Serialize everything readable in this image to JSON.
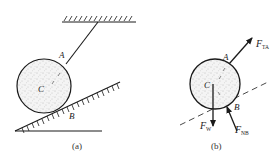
{
  "figure_a": {
    "caption": "(a)",
    "labels": {
      "A": "A",
      "C": "C",
      "B": "B"
    },
    "elements": [
      "ceiling-support",
      "rope",
      "ball",
      "inclined-plane",
      "ground-line"
    ]
  },
  "figure_b": {
    "caption": "(b)",
    "labels": {
      "A": "A",
      "C": "C",
      "B": "B"
    },
    "forces": [
      {
        "symbol": "F",
        "subscript": "TA"
      },
      {
        "symbol": "F",
        "subscript": "W"
      },
      {
        "symbol": "F",
        "subscript": "NB"
      }
    ]
  },
  "colors": {
    "line": "#1a1a1a",
    "stipple": "#9a9a9a",
    "background": "#ffffff"
  }
}
